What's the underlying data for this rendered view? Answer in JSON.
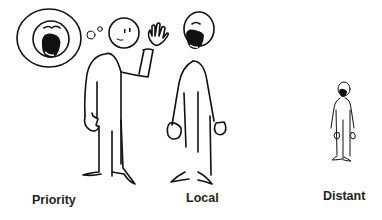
{
  "figures": [
    {
      "id": "priority",
      "label": "Priority",
      "description": "figure waving with a thought bubble showing a shouting face"
    },
    {
      "id": "local",
      "label": "Local",
      "description": "figure shouting with open mouth"
    },
    {
      "id": "distant",
      "label": "Distant",
      "description": "small distant figure shouting"
    }
  ],
  "colors": {
    "line": "#111111",
    "background": "#ffffff",
    "label": "#1f1f1f"
  }
}
